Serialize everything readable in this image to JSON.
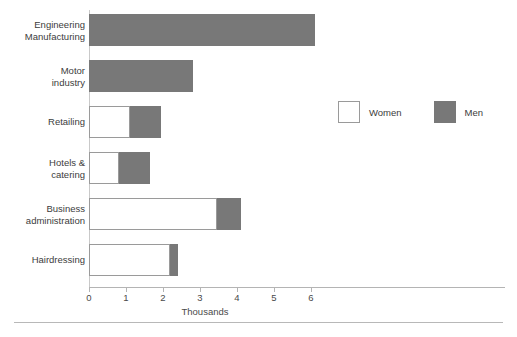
{
  "chart_data": {
    "type": "bar",
    "orientation": "horizontal",
    "stacked": true,
    "title": "",
    "xlabel": "Thousands",
    "ylabel": "",
    "xlim": [
      0,
      6.8
    ],
    "xticks": [
      0,
      1,
      2,
      3,
      4,
      5,
      6
    ],
    "xtick_labels": [
      "0",
      "1",
      "2",
      "3",
      "4",
      "5",
      "6"
    ],
    "grid": false,
    "legend_position": "upper right",
    "categories": [
      "Engineering\nManufacturing",
      "Motor\nindustry",
      "Retailing",
      "Hotels &\ncatering",
      "Business\nadministration",
      "Hairdressing"
    ],
    "series": [
      {
        "name": "Women",
        "color": "#ffffff",
        "values": [
          0,
          0,
          1.1,
          0.8,
          3.45,
          2.2
        ]
      },
      {
        "name": "Men",
        "color": "#787878",
        "values": [
          6.1,
          2.8,
          0.85,
          0.85,
          0.65,
          0.2
        ]
      }
    ],
    "totals": [
      6.1,
      2.8,
      1.95,
      1.65,
      4.1,
      2.4
    ]
  },
  "legend": {
    "items": [
      {
        "label": "Women",
        "swatch": "white-square"
      },
      {
        "label": "Men",
        "swatch": "gray-square"
      }
    ]
  }
}
